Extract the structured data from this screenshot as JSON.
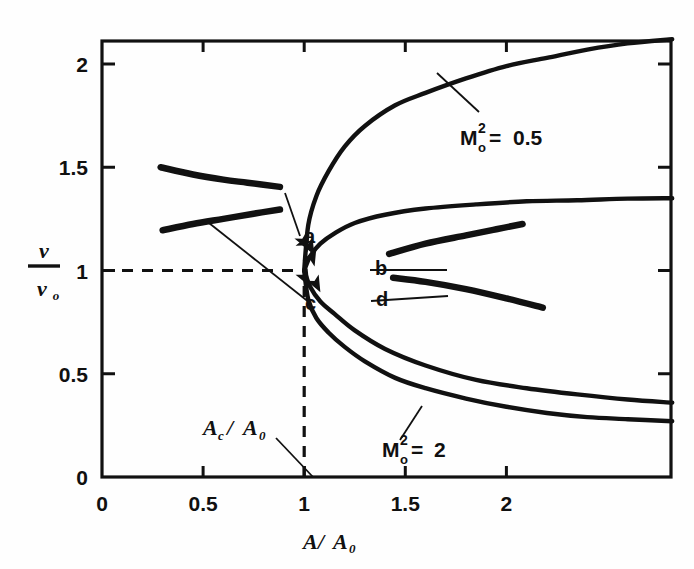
{
  "chart_data": {
    "type": "line",
    "title": "",
    "xlabel": "A/A_0",
    "ylabel": "v/v_0",
    "xlim": [
      0,
      2.82
    ],
    "ylim": [
      0,
      2.12
    ],
    "grid": false,
    "legend_position": "inline-annotations",
    "x_ticks": [
      "0",
      "0.5",
      "1",
      "1.5",
      "2"
    ],
    "x_tick_values": [
      0,
      0.5,
      1,
      1.5,
      2
    ],
    "y_ticks": [
      "0",
      "0.5",
      "1",
      "1.5",
      "2"
    ],
    "y_tick_values": [
      0,
      0.5,
      1,
      1.5,
      2
    ],
    "annotations": [
      {
        "text": "M₀²= 0.5",
        "symbol": "M",
        "sub": "o",
        "sup": "2",
        "value": "0.5",
        "x": 1.62,
        "y": 1.74
      },
      {
        "text": "M₀²= 2",
        "symbol": "M",
        "sub": "o",
        "sup": "2",
        "value": "2",
        "x": 1.33,
        "y": 0.32
      },
      {
        "text": "A_c/A_0",
        "x": 0.85,
        "y": 0.22
      },
      {
        "text": "a",
        "x": 0.98,
        "y": 1.2
      },
      {
        "text": "b",
        "x": 1.3,
        "y": 1.04
      },
      {
        "text": "c",
        "x": 0.99,
        "y": 0.93
      },
      {
        "text": "d",
        "x": 1.3,
        "y": 0.91
      }
    ],
    "series": [
      {
        "name": "M0^2 = 0.5 upper branch",
        "comment": "subsonic-to-supersonic upper branch rising from the turning point at (1,1) to 2.12 at right edge",
        "x": [
          1.0,
          1.02,
          1.06,
          1.12,
          1.2,
          1.3,
          1.45,
          1.6,
          1.8,
          2.0,
          2.2,
          2.4,
          2.6,
          2.82
        ],
        "y": [
          1.0,
          1.22,
          1.36,
          1.48,
          1.6,
          1.7,
          1.8,
          1.86,
          1.93,
          1.99,
          2.03,
          2.07,
          2.1,
          2.12
        ]
      },
      {
        "name": "M0^2 = 0.5 lower branch",
        "comment": "lower branch from turning point at (1,1) descending to 0.27 at right edge",
        "x": [
          1.0,
          1.02,
          1.06,
          1.12,
          1.2,
          1.3,
          1.45,
          1.6,
          1.8,
          2.0,
          2.2,
          2.4,
          2.6,
          2.82
        ],
        "y": [
          1.0,
          0.86,
          0.77,
          0.7,
          0.63,
          0.56,
          0.48,
          0.43,
          0.38,
          0.34,
          0.31,
          0.29,
          0.28,
          0.27
        ]
      },
      {
        "name": "M0^2 = 2 upper branch",
        "comment": "upper branch from turning point at (1,1) rising to 1.35 at right edge",
        "x": [
          1.0,
          1.03,
          1.08,
          1.15,
          1.25,
          1.4,
          1.6,
          1.85,
          2.1,
          2.35,
          2.6,
          2.82
        ],
        "y": [
          1.0,
          1.07,
          1.13,
          1.18,
          1.23,
          1.27,
          1.3,
          1.32,
          1.335,
          1.34,
          1.348,
          1.35
        ]
      },
      {
        "name": "M0^2 = 2 lower branch",
        "comment": "lower branch from turning point at (1,1) descending to 0.36 at right edge",
        "x": [
          1.0,
          1.03,
          1.08,
          1.15,
          1.25,
          1.4,
          1.6,
          1.85,
          2.1,
          2.35,
          2.6,
          2.82
        ],
        "y": [
          1.0,
          0.92,
          0.85,
          0.79,
          0.71,
          0.62,
          0.54,
          0.47,
          0.43,
          0.4,
          0.375,
          0.36
        ]
      },
      {
        "name": "segment a",
        "comment": "short thick arc upper-left, labeled a region",
        "x": [
          0.29,
          0.45,
          0.6,
          0.72,
          0.88
        ],
        "y": [
          1.5,
          1.465,
          1.44,
          1.425,
          1.405
        ]
      },
      {
        "name": "segment c",
        "comment": "short thick arc lower-left, labeled c region",
        "x": [
          0.3,
          0.45,
          0.6,
          0.75,
          0.88
        ],
        "y": [
          1.195,
          1.225,
          1.25,
          1.275,
          1.295
        ]
      },
      {
        "name": "segment b",
        "comment": "short thick arc right-upper, labeled b region",
        "x": [
          1.42,
          1.6,
          1.8,
          1.95,
          2.08
        ],
        "y": [
          1.08,
          1.13,
          1.17,
          1.2,
          1.225
        ]
      },
      {
        "name": "segment d",
        "comment": "short thick arc right-lower, labeled d region",
        "x": [
          1.44,
          1.6,
          1.8,
          2.0,
          2.18
        ],
        "y": [
          0.965,
          0.945,
          0.91,
          0.865,
          0.82
        ]
      }
    ],
    "reference_lines": [
      {
        "name": "horizontal v/v0 = 1",
        "orientation": "horizontal",
        "value": 1,
        "style": "dashed",
        "from_x": 0,
        "to_x": 1.0
      },
      {
        "name": "vertical A/A0 = 1 (A_c/A_0)",
        "orientation": "vertical",
        "value": 1,
        "style": "dashed",
        "from_y": 0,
        "to_y": 0.98
      }
    ],
    "arrow_markers": [
      {
        "on": "M0^2 = 0.5 upper branch",
        "direction": "up-right",
        "x": 1.025,
        "y": 1.175
      },
      {
        "on": "M0^2 = 2 upper branch",
        "direction": "up-right",
        "x": 1.06,
        "y": 1.105
      },
      {
        "on": "M0^2 = 0.5 lower branch",
        "direction": "down-right",
        "x": 1.02,
        "y": 1.1
      },
      {
        "on": "M0^2 = 2 lower branch",
        "direction": "down-right",
        "x": 1.05,
        "y": 1.075
      },
      {
        "on": "M0^2 = 0.5 lower branch",
        "direction": "down-right",
        "x": 1.025,
        "y": 0.925
      },
      {
        "on": "M0^2 = 2 lower branch",
        "direction": "down-right",
        "x": 1.08,
        "y": 0.895
      }
    ],
    "leader_lines": [
      {
        "from_label": "a",
        "to_point": [
          0.89,
          1.295
        ]
      },
      {
        "from_label": "c",
        "to_point": [
          0.53,
          1.155
        ]
      },
      {
        "from_label": "b",
        "to_point": [
          1.41,
          1.075
        ]
      },
      {
        "from_label": "d",
        "to_point": [
          1.43,
          0.965
        ]
      },
      {
        "from_label": "M0^2 = 0.5",
        "to_point": [
          1.52,
          1.9
        ]
      },
      {
        "from_label": "M0^2 = 2",
        "to_point": [
          1.38,
          0.5
        ]
      },
      {
        "from_label": "A_c/A_0",
        "to_point": [
          1.0,
          0.0
        ]
      }
    ]
  },
  "axis": {
    "y_label_numerator": "v",
    "y_label_denominator": "v",
    "y_label_denominator_sub": "o",
    "x_label_main": "A",
    "x_label_slash": "/",
    "x_label_den": "A",
    "x_label_den_sub": "0"
  },
  "labels": {
    "a": "a",
    "b": "b",
    "c": "c",
    "d": "d",
    "m_symbol": "M",
    "m_sub": "o",
    "m_sup": "2",
    "eq": "=",
    "m1_value": "0.5",
    "m2_value": "2",
    "ac_a": "A",
    "ac_sub": "c",
    "ac_slash": "/",
    "ac_den": "A",
    "ac_den_sub": "0"
  },
  "ticks": {
    "x": [
      "0",
      "0.5",
      "1",
      "1.5",
      "2"
    ],
    "y": [
      "0",
      "0.5",
      "1",
      "1.5",
      "2"
    ]
  },
  "style": {
    "curve_color": "#111111",
    "axis_color": "#111111",
    "background": "#fefefe"
  }
}
